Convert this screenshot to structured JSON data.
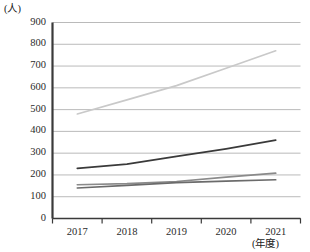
{
  "chart_data": {
    "type": "line",
    "title": "",
    "subtitle": "",
    "xlabel": "(年度)",
    "ylabel": "(人)",
    "categories": [
      "2017",
      "2018",
      "2019",
      "2020",
      "2021"
    ],
    "x": [
      2017,
      2018,
      2019,
      2020,
      2021
    ],
    "ylim": [
      0,
      900
    ],
    "ytick_step": 100,
    "ytick_labels": [
      "900",
      "800",
      "700",
      "600",
      "500",
      "400",
      "300",
      "200",
      "100",
      "0"
    ],
    "ytick_values": [
      900,
      800,
      700,
      600,
      500,
      400,
      300,
      200,
      100,
      0
    ],
    "grid": true,
    "legend": "none",
    "series": [
      {
        "name": "series-1",
        "color": "#c9c9c9",
        "values": [
          480,
          545,
          610,
          690,
          770
        ]
      },
      {
        "name": "series-2",
        "color": "#3a3a3a",
        "values": [
          230,
          250,
          285,
          320,
          360
        ]
      },
      {
        "name": "series-3",
        "color": "#8a8a8a",
        "values": [
          155,
          160,
          170,
          190,
          208
        ]
      },
      {
        "name": "series-4",
        "color": "#6b6b6b",
        "values": [
          140,
          152,
          165,
          172,
          178
        ]
      }
    ]
  },
  "axes": {
    "y_unit_label": "(人)",
    "x_unit_label": "(年度)"
  }
}
